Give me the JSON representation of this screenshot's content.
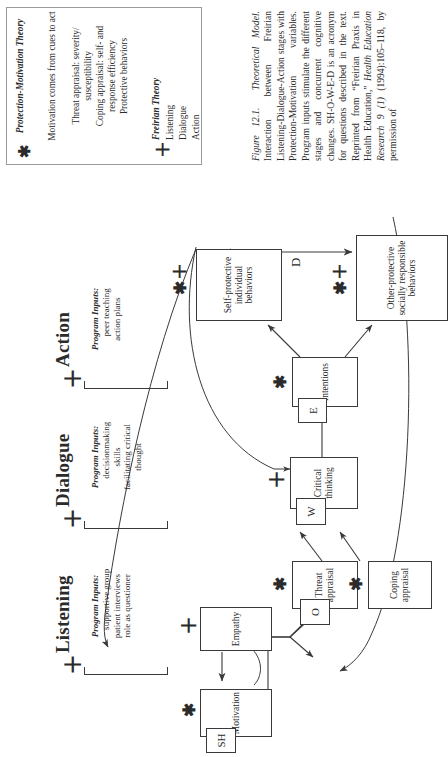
{
  "figure": {
    "number": "Figure 12.1.",
    "short_title": "Theoretical Model.",
    "caption_lines": [
      "Interaction between Freirian Listening-",
      "Dialogue-Action stages with Protec-",
      "tion-Motivation variables. Program",
      "inputs stimulate the different stages",
      "and concurrent cognitive changes.",
      "SH-O-W-E-D is an acronym for ques-",
      "tions described in the text. Reprinted",
      "from “Freirian Praxis in Health Edu-",
      "cation,” ",
      "Health Education Research 9 (1)",
      "(1994):105–118, by permission of"
    ],
    "caption_plain": "Interaction between Freirian Listening-Dialogue-Action stages with Protection-Motivation variables. Program inputs stimulate the different stages and concurrent cognitive changes. SH-O-W-E-D is an acronym for questions described in the text. Reprinted from “Freirian Praxis in Health Education,” Health Education Research 9 (1) (1994):105–118, by permission of",
    "journal_italic": "Health Education Research 9 (1)"
  },
  "legend": {
    "entries": [
      {
        "symbol": "✱",
        "symbol_name": "asterisk-symbol",
        "title": "Protection-Motivation\nTheory",
        "items": [
          "Motivation comes from\ncues to act",
          "Threat appraisal: severity/\nsusceptibility",
          "Coping appraisal: self- and\nresponse efficiency",
          "Protective behaviors"
        ]
      },
      {
        "symbol": "＋",
        "symbol_name": "plus-symbol",
        "title": "Freirian Theory",
        "items": [
          "Listening",
          "Dialogue",
          "Action"
        ]
      }
    ]
  },
  "stages": [
    {
      "label": "Listening",
      "symbol": "＋",
      "inputs_title": "Program Inputs:",
      "inputs_body": "supportive group\npatient interviews\nrole as questioner"
    },
    {
      "label": "Dialogue",
      "symbol": "＋",
      "inputs_title": "Program Inputs:",
      "inputs_body": "decisionmaking\nskills\nfacilitating critical\nthought"
    },
    {
      "label": "Action",
      "symbol": "＋",
      "inputs_title": "Program Inputs:",
      "inputs_body": "peer teaching\naction plans"
    }
  ],
  "nodes": [
    {
      "id": "motivation",
      "label": "Motivation",
      "tag": "SH",
      "mark": "✱"
    },
    {
      "id": "empathy",
      "label": "Empathy",
      "tag": "",
      "mark": "＋"
    },
    {
      "id": "threat",
      "label": "Threat\nappraisal",
      "tag": "O",
      "mark": "✱"
    },
    {
      "id": "coping",
      "label": "Coping\nappraisal",
      "tag": "",
      "mark": "✱"
    },
    {
      "id": "critical",
      "label": "Critical\nthinking",
      "tag": "W",
      "mark": "＋"
    },
    {
      "id": "intentions",
      "label": "Intentions",
      "tag": "E",
      "mark": "✱"
    },
    {
      "id": "selfprot",
      "label": "Self-protective\nindividual\nbehaviors",
      "tag": "",
      "mark": "✱＋"
    },
    {
      "id": "otherprot",
      "label": "Other-protective\nsocially responsible\nbehaviors",
      "tag": "",
      "mark": "✱＋"
    }
  ],
  "edge_labels": {
    "d": "D"
  },
  "colors": {
    "ink": "#2b2b2b",
    "line": "#3a3a3a",
    "legend_border": "#9a9a9a",
    "paper": "#ffffff"
  }
}
